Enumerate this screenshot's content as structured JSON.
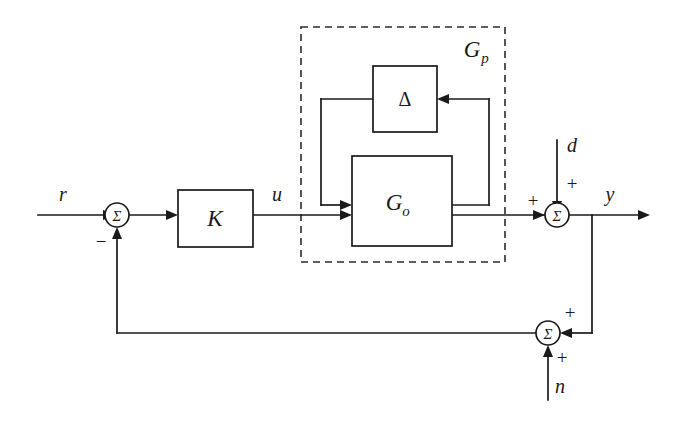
{
  "figure": {
    "kind": "control-system-block-diagram",
    "background_color": "#ffffff",
    "line_color": "#1a1a1a",
    "width": 675,
    "height": 421
  },
  "signals": {
    "reference": "r",
    "control": "u",
    "disturbance": "d",
    "output": "y",
    "noise": "n"
  },
  "blocks": {
    "controller": "K",
    "nominal_plant": "G",
    "nominal_plant_sub": "o",
    "uncertainty": "Δ",
    "plant_group": "G",
    "plant_group_sub": "p"
  },
  "summing_junctions": {
    "glyph": "Σ",
    "error_junction": {
      "name": "error-sum",
      "input_sign": "+",
      "feedback_sign": "−"
    },
    "disturbance_junction": {
      "name": "disturbance-sum",
      "forward_sign": "+",
      "disturbance_sign": "+"
    },
    "noise_junction": {
      "name": "noise-sum",
      "measurement_sign": "+",
      "noise_sign": "+"
    }
  },
  "signs": {
    "minus": "−",
    "plus": "+"
  }
}
